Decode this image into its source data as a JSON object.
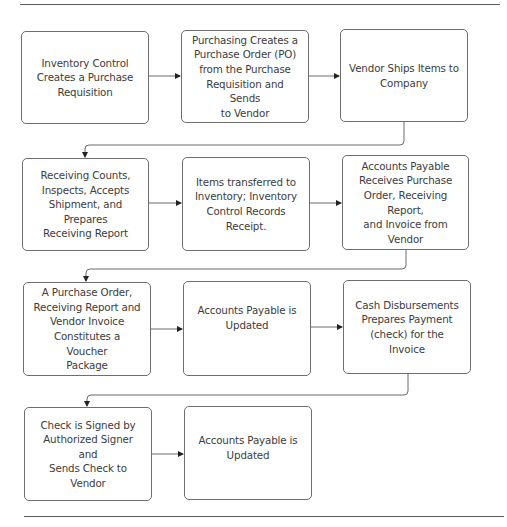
{
  "diagram": {
    "type": "flowchart",
    "title": "",
    "rows": [
      {
        "steps": [
          {
            "id": "s1",
            "label": "Inventory Control\nCreates a Purchase\nRequisition"
          },
          {
            "id": "s2",
            "label": "Purchasing Creates a\nPurchase Order (PO)\nfrom the Purchase\nRequisition and Sends\nto Vendor"
          },
          {
            "id": "s3",
            "label": "Vendor Ships Items to\nCompany"
          }
        ]
      },
      {
        "steps": [
          {
            "id": "s4",
            "label": "Receiving Counts,\nInspects, Accepts\nShipment, and Prepares\nReceiving Report"
          },
          {
            "id": "s5",
            "label": "Items transferred to\nInventory;  Inventory\nControl Records\nReceipt."
          },
          {
            "id": "s6",
            "label": "Accounts Payable\nReceives Purchase\nOrder, Receiving Report,\nand Invoice from\nVendor"
          }
        ]
      },
      {
        "steps": [
          {
            "id": "s7",
            "label": "A Purchase Order,\nReceiving Report and\nVendor Invoice\nConstitutes a Voucher\nPackage"
          },
          {
            "id": "s8",
            "label": "Accounts Payable is\nUpdated"
          },
          {
            "id": "s9",
            "label": "Cash Disbursements\nPrepares Payment\n(check) for the Invoice"
          }
        ]
      },
      {
        "steps": [
          {
            "id": "s10",
            "label": "Check is Signed by\nAuthorized Signer and\nSends Check to Vendor"
          },
          {
            "id": "s11",
            "label": "Accounts Payable is\nUpdated"
          }
        ]
      }
    ],
    "edges": [
      [
        "s1",
        "s2"
      ],
      [
        "s2",
        "s3"
      ],
      [
        "s3",
        "s4"
      ],
      [
        "s4",
        "s5"
      ],
      [
        "s5",
        "s6"
      ],
      [
        "s6",
        "s7"
      ],
      [
        "s7",
        "s8"
      ],
      [
        "s8",
        "s9"
      ],
      [
        "s9",
        "s10"
      ],
      [
        "s10",
        "s11"
      ]
    ],
    "colors": {
      "box_border": "#6e6e6e",
      "text": "#3c3c3c",
      "connector": "#6a6a6a",
      "arrowhead": "#222222",
      "rule": "#5a5a5a"
    }
  }
}
